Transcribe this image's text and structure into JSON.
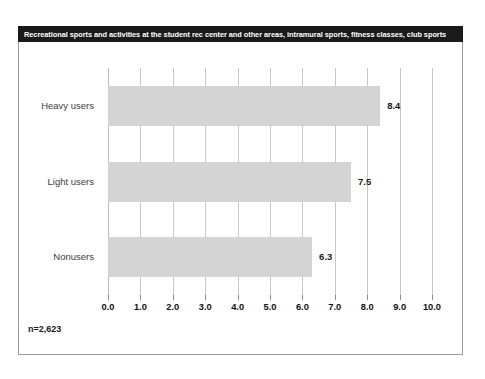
{
  "title": "Recreational sports and activities at the student rec center and other areas, intramural sports, fitness classes, club sports",
  "footnote": "n=2,623",
  "colors": {
    "title_bar_background": "#1a1a1a",
    "title_bar_text": "#ffffff",
    "bar_fill": "#d4d4d4",
    "gridline": "#c9c9c9",
    "frame_border": "#9a9a9a",
    "tick_label": "#111111",
    "category_label": "#3d3d3d"
  },
  "chart_data": {
    "type": "bar",
    "orientation": "horizontal",
    "title": "Recreational sports and activities at the student rec center and other areas, intramural sports, fitness classes, club sports",
    "categories": [
      "Heavy users",
      "Light users",
      "Nonusers"
    ],
    "values": [
      8.4,
      7.5,
      6.3
    ],
    "value_labels": [
      "8.4",
      "7.5",
      "6.3"
    ],
    "xlabel": "",
    "ylabel": "",
    "xlim": [
      0.0,
      10.0
    ],
    "xticks": [
      0.0,
      1.0,
      2.0,
      3.0,
      4.0,
      5.0,
      6.0,
      7.0,
      8.0,
      9.0,
      10.0
    ],
    "xtick_labels": [
      "0.0",
      "1.0",
      "2.0",
      "3.0",
      "4.0",
      "5.0",
      "6.0",
      "7.0",
      "8.0",
      "9.0",
      "10.0"
    ],
    "grid": true,
    "legend": null,
    "annotations": [
      "n=2,623"
    ]
  }
}
